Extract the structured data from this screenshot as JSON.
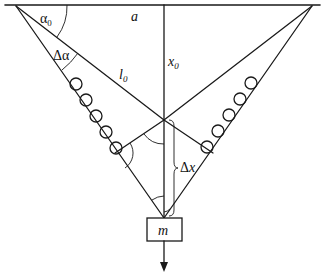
{
  "diagram": {
    "labels": {
      "alpha0": {
        "main": "α",
        "sub": "0"
      },
      "delta_alpha": "Δα",
      "a": "a",
      "l0": {
        "main": "l",
        "sub": "0"
      },
      "x0": {
        "main": "x",
        "sub": "0"
      },
      "delta_x": "Δx",
      "mass": "m"
    },
    "geometry": {
      "ceiling": {
        "x1": 5,
        "y1": 5,
        "x2": 320,
        "y2": 5
      },
      "left_anchor": {
        "x": 16,
        "y": 6
      },
      "right_anchor": {
        "x": 312,
        "y": 6
      },
      "equilibrium_point": {
        "x": 164,
        "y": 120
      },
      "displaced_point": {
        "x": 164,
        "y": 218
      },
      "mass_box": {
        "x": 147,
        "y": 218,
        "width": 35,
        "height": 23
      },
      "force_arrow": {
        "x": 164,
        "y1": 241,
        "y2": 270
      },
      "left_springs": [
        [
          76,
          84
        ],
        [
          86,
          100
        ],
        [
          96,
          116
        ],
        [
          106,
          132
        ],
        [
          116,
          148
        ]
      ],
      "right_springs": [
        [
          250,
          84
        ],
        [
          239,
          100
        ],
        [
          228,
          116
        ],
        [
          217,
          132
        ],
        [
          206,
          148
        ]
      ],
      "spring_radius": 6
    },
    "colors": {
      "stroke": "#1a1a1a",
      "background": "#ffffff"
    }
  }
}
